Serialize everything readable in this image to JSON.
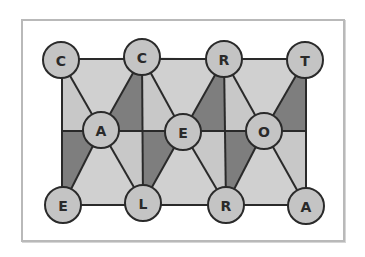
{
  "diagram": {
    "colors": {
      "frame_border": "#b9b9b9",
      "light_fill": "#c8c8c8",
      "dark_fill": "#7e7e7e",
      "circle_fill": "#c4c4c4",
      "stroke": "#2a2a2a"
    },
    "rows": {
      "top": [
        "C",
        "C",
        "R",
        "T"
      ],
      "middle": [
        "A",
        "E",
        "O"
      ],
      "bottom": [
        "E",
        "L",
        "R",
        "A"
      ]
    },
    "nodes": [
      {
        "id": "t1",
        "label": "C",
        "x": 61,
        "y": 60
      },
      {
        "id": "t2",
        "label": "C",
        "x": 142,
        "y": 57
      },
      {
        "id": "t3",
        "label": "R",
        "x": 224,
        "y": 59
      },
      {
        "id": "t4",
        "label": "T",
        "x": 305,
        "y": 60
      },
      {
        "id": "m1",
        "label": "A",
        "x": 101,
        "y": 130
      },
      {
        "id": "m2",
        "label": "E",
        "x": 183,
        "y": 132
      },
      {
        "id": "m3",
        "label": "O",
        "x": 264,
        "y": 131
      },
      {
        "id": "b1",
        "label": "E",
        "x": 63,
        "y": 205
      },
      {
        "id": "b2",
        "label": "L",
        "x": 143,
        "y": 203
      },
      {
        "id": "b3",
        "label": "R",
        "x": 226,
        "y": 205
      },
      {
        "id": "b4",
        "label": "A",
        "x": 306,
        "y": 206
      }
    ]
  }
}
